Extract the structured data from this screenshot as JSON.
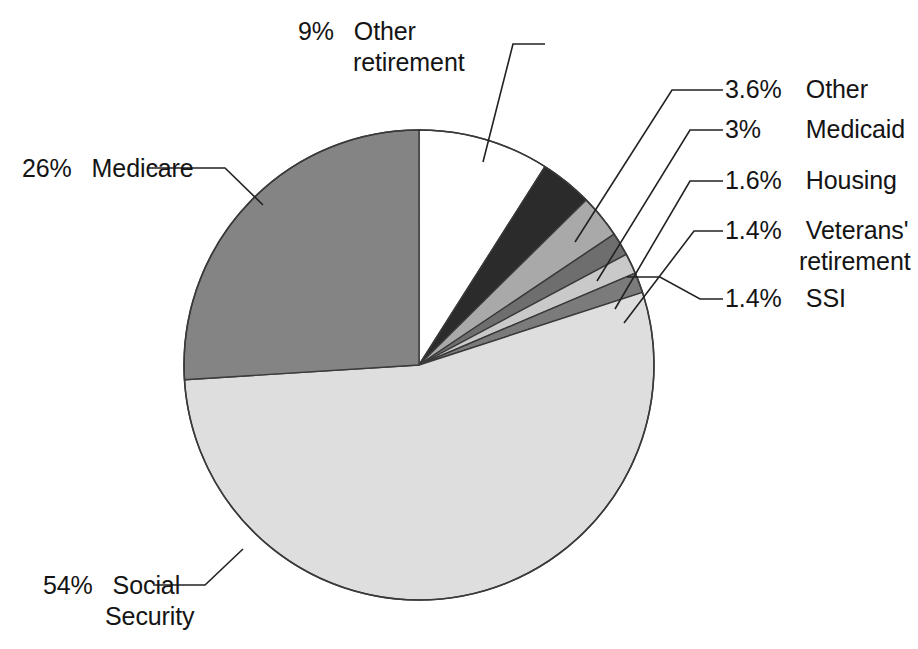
{
  "figure": {
    "background": "#ffffff",
    "outline_color": "#333333",
    "leader_color": "#222222",
    "width": 918,
    "height": 649
  },
  "chart_data": {
    "type": "pie",
    "title": "",
    "subtitle": "",
    "xlabel": "",
    "ylabel": "",
    "legend_position": "callout-labels",
    "grid": false,
    "units": "percent",
    "start_angle_deg": 0,
    "direction": "clockwise",
    "center": {
      "x": 419,
      "y": 365
    },
    "radius": 235,
    "categories": [
      "Other retirement",
      "Other",
      "Medicaid",
      "Housing",
      "Veterans' retirement",
      "SSI",
      "Social Security",
      "Medicare"
    ],
    "values": [
      9,
      3.6,
      3,
      1.6,
      1.4,
      1.4,
      54,
      26
    ],
    "value_labels": [
      "9%",
      "3.6%",
      "3%",
      "1.6%",
      "1.4%",
      "1.4%",
      "54%",
      "26%"
    ],
    "colors": [
      "#ffffff",
      "#2b2b2b",
      "#a9a9a9",
      "#6e6e6e",
      "#c9c9c9",
      "#7b7b7b",
      "#dedede",
      "#848484"
    ],
    "slices": [
      {
        "label": "Other retirement",
        "value": 9,
        "value_label": "9%",
        "color": "#ffffff"
      },
      {
        "label": "Other",
        "value": 3.6,
        "value_label": "3.6%",
        "color": "#2b2b2b"
      },
      {
        "label": "Medicaid",
        "value": 3,
        "value_label": "3%",
        "color": "#a9a9a9"
      },
      {
        "label": "Housing",
        "value": 1.6,
        "value_label": "1.6%",
        "color": "#6e6e6e"
      },
      {
        "label": "Veterans' retirement",
        "value": 1.4,
        "value_label": "1.4%",
        "color": "#c9c9c9"
      },
      {
        "label": "SSI",
        "value": 1.4,
        "value_label": "1.4%",
        "color": "#7b7b7b"
      },
      {
        "label": "Social Security",
        "value": 54,
        "value_label": "54%",
        "color": "#dedede"
      },
      {
        "label": "Medicare",
        "value": 26,
        "value_label": "26%",
        "color": "#848484"
      }
    ]
  },
  "callouts": {
    "other_retirement": {
      "pct": "9%",
      "name": "Other",
      "name2": "retirement"
    },
    "other": {
      "pct": "3.6%",
      "name": "Other"
    },
    "medicaid": {
      "pct": "3%",
      "name": "Medicaid"
    },
    "housing": {
      "pct": "1.6%",
      "name": "Housing"
    },
    "veterans": {
      "pct": "1.4%",
      "name": "Veterans'",
      "name2": "retirement"
    },
    "ssi": {
      "pct": "1.4%",
      "name": "SSI"
    },
    "medicare": {
      "pct": "26%",
      "name": "Medicare"
    },
    "social_security": {
      "pct": "54%",
      "name": "Social",
      "name2": "Security"
    }
  }
}
